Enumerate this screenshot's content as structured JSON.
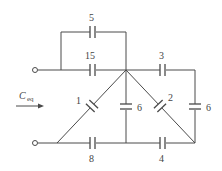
{
  "diagram": {
    "type": "capacitor-network",
    "equivalent_label": {
      "main": "C",
      "sub": "eq"
    },
    "capacitors": [
      {
        "id": "c5",
        "value": "5"
      },
      {
        "id": "c15",
        "value": "15"
      },
      {
        "id": "c3",
        "value": "3"
      },
      {
        "id": "c1",
        "value": "1"
      },
      {
        "id": "c6_center",
        "value": "6"
      },
      {
        "id": "c2",
        "value": "2"
      },
      {
        "id": "c6_right",
        "value": "6"
      },
      {
        "id": "c8",
        "value": "8"
      },
      {
        "id": "c4",
        "value": "4"
      }
    ],
    "terminals": [
      "top-left",
      "bottom-left"
    ]
  }
}
